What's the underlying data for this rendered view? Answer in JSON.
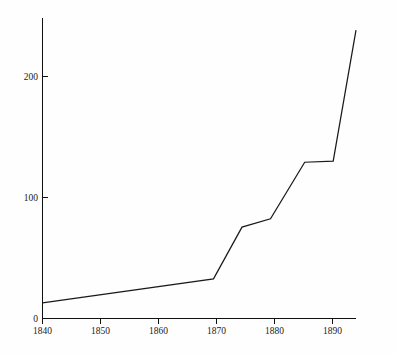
{
  "chart_data": {
    "type": "line",
    "title": "",
    "subtitle": "",
    "xlabel": "",
    "ylabel": "",
    "xlim": [
      1840,
      1895
    ],
    "ylim": [
      0,
      250
    ],
    "grid": false,
    "legend": null,
    "x": [
      1840,
      1870,
      1875,
      1880,
      1886,
      1891,
      1895
    ],
    "values": [
      13,
      33,
      76,
      83,
      130,
      131,
      240
    ],
    "series": [
      {
        "name": "series-1",
        "x": [
          1840,
          1870,
          1875,
          1880,
          1886,
          1891,
          1895
        ],
        "values": [
          13,
          33,
          76,
          83,
          130,
          131,
          240
        ],
        "color": "#1a1a1a"
      }
    ],
    "x_ticks": [
      1840,
      1850,
      1860,
      1870,
      1880,
      1890
    ],
    "x_tick_labels": [
      "1840",
      "1850",
      "1860",
      "1870",
      "1880",
      "1890"
    ],
    "y_ticks": [
      0,
      100,
      200
    ],
    "y_tick_labels": [
      "0",
      "100",
      "200"
    ],
    "annotations": []
  },
  "axes": {
    "y_axis_name": "y-axis",
    "x_axis_name": "x-axis"
  },
  "colors": {
    "line": "#1a1a1a",
    "axis": "#111111",
    "background": "#fefefe",
    "text": "#1a1a1a"
  }
}
